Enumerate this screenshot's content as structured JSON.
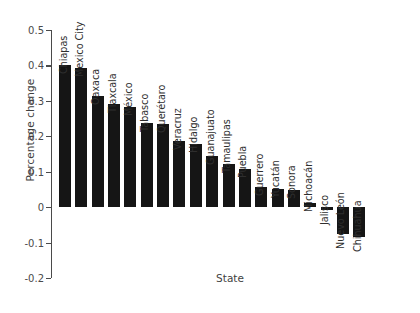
{
  "chart_data": {
    "type": "bar",
    "title": "",
    "xlabel": "State",
    "ylabel": "Percentage change",
    "ylim": [
      -0.2,
      0.5
    ],
    "yticks": [
      "0.5",
      "0.4",
      "0.3",
      "0.2",
      "0.1",
      "0",
      "-0.1",
      "-0.2"
    ],
    "ytick_values": [
      0.5,
      0.4,
      0.3,
      0.2,
      0.1,
      0,
      -0.1,
      -0.2
    ],
    "grid": false,
    "legend": null,
    "bar_color": "#151515",
    "categories": [
      "Chiapas",
      "Mexico City",
      "Oaxaca",
      "Tlaxcala",
      "México",
      "Tabasco",
      "Querétaro",
      "Veracruz",
      "Hidalgo",
      "Guanajuato",
      "Tamaulipas",
      "Puebla",
      "Guerrero",
      "Yucatán",
      "Sonora",
      "Michoacán",
      "Jalisco",
      "Nuevo León",
      "Chihuahua"
    ],
    "values": [
      0.402,
      0.392,
      0.313,
      0.29,
      0.283,
      0.238,
      0.235,
      0.188,
      0.177,
      0.143,
      0.123,
      0.107,
      0.058,
      0.05,
      0.048,
      0.012,
      -0.008,
      -0.075,
      -0.085
    ]
  }
}
